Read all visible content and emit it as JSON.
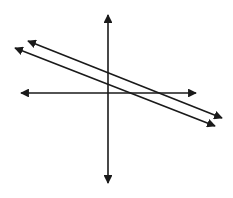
{
  "diagram": {
    "title": "",
    "stroke_color": "#1a1a1a",
    "background": "#ffffff",
    "axes": {
      "x_axis": {
        "x1": 21,
        "y1": 93,
        "x2": 196,
        "y2": 93,
        "arrows": "both"
      },
      "y_axis": {
        "x1": 108,
        "y1": 15,
        "x2": 108,
        "y2": 183,
        "arrows": "both"
      }
    },
    "lines": [
      {
        "name": "upper-line",
        "x1": 28,
        "y1": 41,
        "x2": 222,
        "y2": 118,
        "arrows": "both"
      },
      {
        "name": "lower-line",
        "x1": 15,
        "y1": 48,
        "x2": 215,
        "y2": 126,
        "arrows": "both"
      }
    ],
    "labels": []
  }
}
